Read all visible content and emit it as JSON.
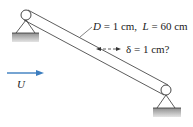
{
  "diagram": {
    "labels": {
      "dimensions_prefix_D": "D",
      "dimensions_mid": " = 1 cm,  ",
      "dimensions_prefix_L": "L",
      "dimensions_suffix": " = 60 cm",
      "deflection": "δ = 1 cm?",
      "flow": "U"
    },
    "colors": {
      "flow_arrow": "#3b7dbf",
      "line": "#333333",
      "ground": "#b8b8b8"
    },
    "values": {
      "diameter": "1 cm",
      "length": "60 cm",
      "deflection": "1 cm"
    }
  }
}
